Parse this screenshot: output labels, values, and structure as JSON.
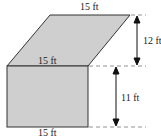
{
  "diagram": {
    "shapes": {
      "parallelogram": {
        "top_label": "15 ft",
        "bottom_label": "15 ft",
        "fill": "#cfcfcf"
      },
      "rectangle": {
        "bottom_label": "15 ft",
        "fill": "#cfcfcf"
      }
    },
    "dimensions": {
      "parallelogram_height": "12 ft",
      "rectangle_height": "11 ft"
    }
  }
}
